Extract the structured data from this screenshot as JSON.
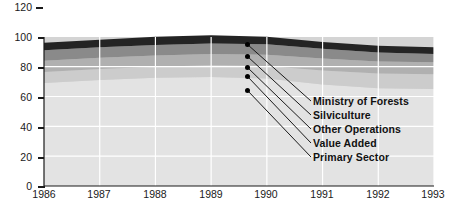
{
  "chart_data": {
    "type": "area",
    "stacked": true,
    "title": "",
    "subtitle": "",
    "xlabel": "",
    "ylabel": "",
    "categories": [
      "1986",
      "1987",
      "1988",
      "1989",
      "1990",
      "1991",
      "1992",
      "1993"
    ],
    "x": [
      1986,
      1987,
      1988,
      1989,
      1990,
      1991,
      1992,
      1993
    ],
    "xlim": [
      1986,
      1993
    ],
    "ylim": [
      0,
      120
    ],
    "yticks": [
      0,
      20,
      40,
      60,
      80,
      100,
      120
    ],
    "ytick_labels": [
      "0",
      "20",
      "40",
      "60",
      "80",
      "100",
      "120"
    ],
    "xtick_labels": [
      "1986",
      "1987",
      "1988",
      "1989",
      "1990",
      "1991",
      "1992",
      "1993"
    ],
    "grid": true,
    "grid_color": "#ffffff",
    "plot_background": "#d4d4d4",
    "legend_position": "inside-annotated-leader-lines",
    "series": [
      {
        "name": "Primary Sector",
        "color": "#e3e3e3",
        "values": [
          69.0,
          71.0,
          72.5,
          73.0,
          72.0,
          68.0,
          65.5,
          65.0
        ]
      },
      {
        "name": "Value Added",
        "color": "#cccccc",
        "values": [
          7.5,
          7.5,
          7.5,
          8.0,
          8.5,
          9.5,
          10.0,
          10.0
        ]
      },
      {
        "name": "Other Operations",
        "color": "#b0b0b0",
        "values": [
          7.5,
          7.5,
          7.5,
          7.5,
          7.5,
          8.0,
          8.0,
          8.0
        ]
      },
      {
        "name": "Silviculture",
        "color": "#8a8a8a",
        "values": [
          7.0,
          7.0,
          7.0,
          7.0,
          7.0,
          6.5,
          6.0,
          5.5
        ]
      },
      {
        "name": "Ministry of Forests",
        "color": "#242424",
        "values": [
          5.0,
          5.0,
          5.5,
          5.5,
          5.0,
          4.5,
          4.5,
          4.5
        ]
      }
    ],
    "totals": [
      96.0,
      98.0,
      100.0,
      101.0,
      100.0,
      96.5,
      94.0,
      93.0
    ],
    "annotations": [
      {
        "label": "Ministry of Forests",
        "marker_x": 1989.75,
        "marker_value": 95.0
      },
      {
        "label": "Silviculture",
        "marker_x": 1989.75,
        "marker_value": 87.0
      },
      {
        "label": "Other Operations",
        "marker_x": 1989.75,
        "marker_value": 80.0
      },
      {
        "label": "Value Added",
        "marker_x": 1989.75,
        "marker_value": 74.0
      },
      {
        "label": "Primary Sector",
        "marker_x": 1989.75,
        "marker_value": 65.0
      }
    ]
  }
}
